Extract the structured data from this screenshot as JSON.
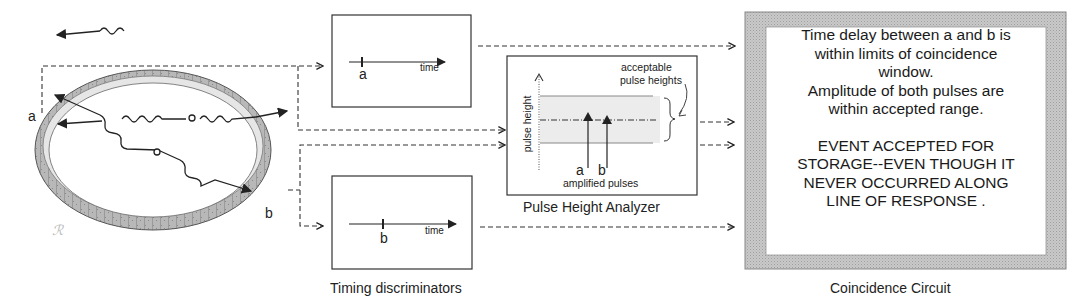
{
  "detector": {
    "label_a": "a",
    "label_b": "b"
  },
  "timing_discriminators": {
    "caption": "Timing discriminators",
    "top": {
      "marker": "a",
      "axis_label": "time"
    },
    "bottom": {
      "marker": "b",
      "axis_label": "time"
    }
  },
  "pulse_height_analyzer": {
    "caption": "Pulse Height Analyzer",
    "y_axis_label": "pulse height",
    "window_label_line1": "acceptable",
    "window_label_line2": "pulse heights",
    "pulse_a": "a",
    "pulse_b": "b",
    "pulses_label": "amplified pulses"
  },
  "coincidence_circuit": {
    "caption": "Coincidence Circuit",
    "lines": [
      "Time delay between a and b is",
      "within limits of  coincidence",
      "window.",
      "Amplitude of both pulses are",
      "within accepted range."
    ],
    "result_lines": [
      "EVENT ACCEPTED FOR",
      "STORAGE--EVEN THOUGH IT",
      "NEVER OCCURRED ALONG",
      "LINE OF RESPONSE ."
    ]
  },
  "colors": {
    "line": "#222222",
    "frame_gray": "#bdbdbd",
    "window_fill": "#e8e8e8",
    "ring_dark": "#9a9a9a",
    "ring_light": "#d8d8d8"
  }
}
